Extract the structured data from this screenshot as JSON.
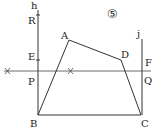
{
  "figure": {
    "number_label": "⑤",
    "lines": {
      "h": "h",
      "j": "j"
    },
    "points": {
      "A": "A",
      "B": "B",
      "C": "C",
      "D": "D",
      "E": "E",
      "F": "F",
      "P": "P",
      "Q": "Q",
      "R": "R"
    },
    "coords": {
      "A": [
        69,
        40
      ],
      "B": [
        38,
        115
      ],
      "C": [
        141,
        115
      ],
      "D": [
        121,
        60
      ],
      "R": [
        38,
        15
      ],
      "E": [
        38,
        60
      ],
      "P": [
        38,
        71
      ],
      "Q": [
        142,
        71
      ]
    }
  }
}
